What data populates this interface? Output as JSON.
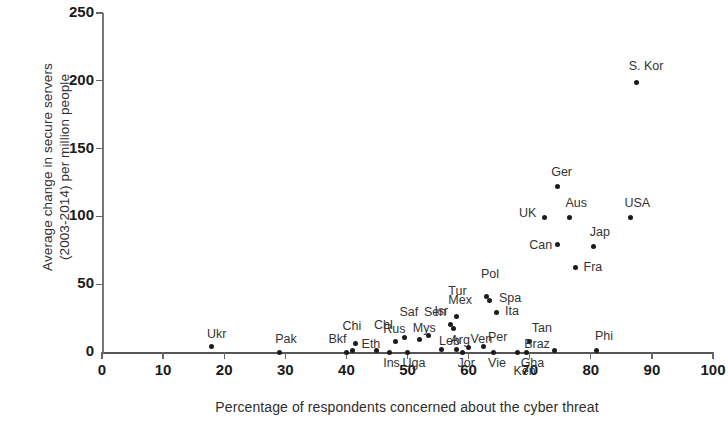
{
  "chart_data": {
    "type": "scatter",
    "title": "",
    "xlabel": "Percentage of respondents concerned about the cyber threat",
    "ylabel": "Average change in secure servers\n(2003-2014) per million people",
    "xlim": [
      0,
      100
    ],
    "ylim": [
      0,
      250
    ],
    "xticks": [
      "0",
      "10",
      "20",
      "30",
      "40",
      "50",
      "60",
      "70",
      "80",
      "90",
      "100"
    ],
    "yticks": [
      "0",
      "50",
      "100",
      "150",
      "200",
      "250"
    ],
    "grid": false,
    "legend": null,
    "marker_color": "#1b1b1b",
    "points": [
      {
        "label": "Ukr",
        "x": 18,
        "y": 4,
        "lx": -5,
        "ly": -20
      },
      {
        "label": "Pak",
        "x": 29,
        "y": 0,
        "lx": -4,
        "ly": -20
      },
      {
        "label": "Bkf",
        "x": 40,
        "y": 0,
        "lx": -18,
        "ly": -20
      },
      {
        "label": "Chi",
        "x": 41,
        "y": 1,
        "lx": -10,
        "ly": -32
      },
      {
        "label": "Eth",
        "x": 41.5,
        "y": 6,
        "lx": 6,
        "ly": -7
      },
      {
        "label": "Chl",
        "x": 45,
        "y": 1,
        "lx": -3,
        "ly": -33
      },
      {
        "label": "Ins",
        "x": 47,
        "y": 0,
        "lx": -6,
        "ly": 4
      },
      {
        "label": "Rus",
        "x": 48,
        "y": 8,
        "lx": -12,
        "ly": -19
      },
      {
        "label": "Saf",
        "x": 49.5,
        "y": 11,
        "lx": -5,
        "ly": -32
      },
      {
        "label": "Uga",
        "x": 50,
        "y": 0,
        "lx": -5,
        "ly": 4
      },
      {
        "label": "Mys",
        "x": 52,
        "y": 9,
        "lx": -7,
        "ly": -19
      },
      {
        "label": "Sen",
        "x": 53.5,
        "y": 12,
        "lx": -5,
        "ly": -31
      },
      {
        "label": "Leb",
        "x": 55.5,
        "y": 2,
        "lx": -2,
        "ly": -15
      },
      {
        "label": "Mex",
        "x": 57,
        "y": 20,
        "lx": -2,
        "ly": -32
      },
      {
        "label": "Tur",
        "x": 57.5,
        "y": 17,
        "lx": -5,
        "ly": -45
      },
      {
        "label": "Isr",
        "x": 58,
        "y": 26,
        "lx": -22,
        "ly": -13
      },
      {
        "label": "Arg",
        "x": 58,
        "y": 2,
        "lx": -6,
        "ly": -16
      },
      {
        "label": "Jor",
        "x": 59,
        "y": 0,
        "lx": -5,
        "ly": 4
      },
      {
        "label": "Ven",
        "x": 60,
        "y": 3,
        "lx": 2,
        "ly": -16
      },
      {
        "label": "Per",
        "x": 62.5,
        "y": 4,
        "lx": 4,
        "ly": -17
      },
      {
        "label": "Vie",
        "x": 64,
        "y": 0,
        "lx": -5,
        "ly": 4
      },
      {
        "label": "Spa",
        "x": 63.5,
        "y": 38,
        "lx": 9,
        "ly": -9
      },
      {
        "label": "Pol",
        "x": 63,
        "y": 41,
        "lx": -6,
        "ly": -29
      },
      {
        "label": "Ita",
        "x": 64.5,
        "y": 29,
        "lx": 9,
        "ly": -9
      },
      {
        "label": "Ken",
        "x": 68,
        "y": 0,
        "lx": -4,
        "ly": 12
      },
      {
        "label": "Gha",
        "x": 69.5,
        "y": 0,
        "lx": -6,
        "ly": 4
      },
      {
        "label": "Tan",
        "x": 70,
        "y": 8,
        "lx": 2,
        "ly": -20
      },
      {
        "label": "Braz",
        "x": 74,
        "y": 1,
        "lx": -30,
        "ly": -14
      },
      {
        "label": "UK",
        "x": 72.5,
        "y": 99,
        "lx": -26,
        "ly": -12
      },
      {
        "label": "Ger",
        "x": 74.5,
        "y": 122,
        "lx": -6,
        "ly": -22
      },
      {
        "label": "Aus",
        "x": 76.5,
        "y": 99,
        "lx": -4,
        "ly": -22
      },
      {
        "label": "Can",
        "x": 74.5,
        "y": 79,
        "lx": -28,
        "ly": -7
      },
      {
        "label": "Jap",
        "x": 80.5,
        "y": 78,
        "lx": -4,
        "ly": -21
      },
      {
        "label": "Fra",
        "x": 77.5,
        "y": 62,
        "lx": 8,
        "ly": -8
      },
      {
        "label": "Phi",
        "x": 81,
        "y": 1,
        "lx": -2,
        "ly": -22
      },
      {
        "label": "USA",
        "x": 86.5,
        "y": 99,
        "lx": -6,
        "ly": -22
      },
      {
        "label": "S. Kor",
        "x": 87.5,
        "y": 199,
        "lx": -8,
        "ly": -23
      }
    ]
  }
}
